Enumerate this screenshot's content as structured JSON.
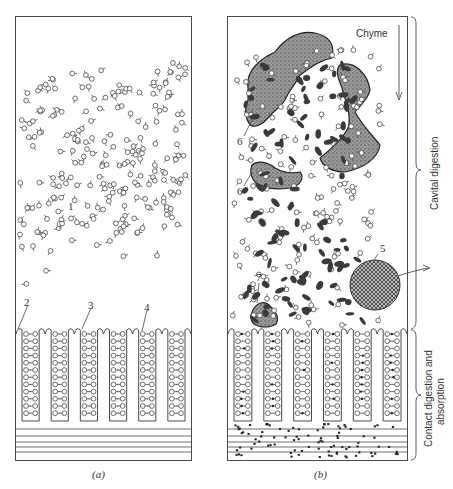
{
  "figure": {
    "panels": [
      {
        "id": "a",
        "caption": "(a)",
        "labels": [
          {
            "text": "1",
            "meaning": "molecules in lumen"
          },
          {
            "text": "2"
          },
          {
            "text": "3"
          },
          {
            "text": "4"
          }
        ]
      },
      {
        "id": "b",
        "caption": "(b)",
        "flow_label": "Chyme",
        "labels": [
          {
            "text": "5"
          },
          {
            "text": "6"
          },
          {
            "text": "6"
          },
          {
            "text": "7"
          }
        ]
      }
    ],
    "brackets": [
      {
        "label": "Cavital digestion"
      },
      {
        "label_line1": "Contact digestion and",
        "label_line2": "absorption"
      }
    ]
  },
  "colors": {
    "stroke": "#4a4a4a",
    "stipple": "#8a8a8a",
    "dark_particle": "#3a3a3a",
    "background": "#ffffff"
  }
}
